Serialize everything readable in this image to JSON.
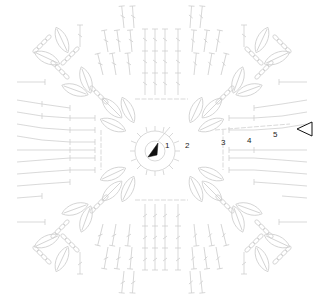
{
  "diagram": {
    "type": "crochet-square-chart",
    "colors": {
      "background": "#ffffff",
      "stitch": "#cfcfcf",
      "marker": "#111111"
    },
    "round_labels": [
      {
        "text": "1",
        "x": 165,
        "y": 142
      },
      {
        "text": "2",
        "x": 185,
        "y": 142
      },
      {
        "text": "3",
        "x": 221,
        "y": 139
      },
      {
        "text": "4",
        "x": 247,
        "y": 137
      },
      {
        "text": "5",
        "x": 273,
        "y": 131
      }
    ],
    "start_marker": "black-filled-arrow",
    "end_marker": "outlined-triangle"
  }
}
